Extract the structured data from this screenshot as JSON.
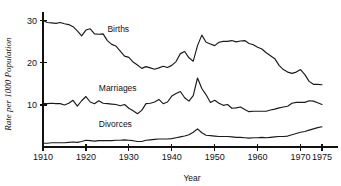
{
  "chart_data": {
    "type": "line",
    "title": "",
    "xlabel": "Year",
    "ylabel": "Rate per 1000 Population",
    "xlim": [
      1910,
      1976
    ],
    "ylim": [
      0,
      32
    ],
    "grid": false,
    "legend_position": "inline-labels",
    "xticks": [
      1910,
      1920,
      1930,
      1940,
      1950,
      1960,
      1970,
      1975
    ],
    "xtick_labels": [
      "1910",
      "1920",
      "1930",
      "1940",
      "1950",
      "1960",
      "1970",
      "1975"
    ],
    "yticks": [
      10,
      20,
      30
    ],
    "ytick_labels": [
      "10",
      "20",
      "30"
    ],
    "x": [
      1910,
      1911,
      1912,
      1913,
      1914,
      1915,
      1916,
      1917,
      1918,
      1919,
      1920,
      1921,
      1922,
      1923,
      1924,
      1925,
      1926,
      1927,
      1928,
      1929,
      1930,
      1931,
      1932,
      1933,
      1934,
      1935,
      1936,
      1937,
      1938,
      1939,
      1940,
      1941,
      1942,
      1943,
      1944,
      1945,
      1946,
      1947,
      1948,
      1949,
      1950,
      1951,
      1952,
      1953,
      1954,
      1955,
      1956,
      1957,
      1958,
      1959,
      1960,
      1961,
      1962,
      1963,
      1964,
      1965,
      1966,
      1967,
      1968,
      1969,
      1970,
      1971,
      1972,
      1973,
      1974,
      1975
    ],
    "series": [
      {
        "name": "Births",
        "label": "Births",
        "label_x": 1925,
        "label_y": 27.3,
        "values": [
          30.1,
          29.6,
          29.5,
          29.4,
          29.6,
          29.3,
          29.1,
          28.6,
          27.6,
          26.4,
          27.8,
          28.1,
          26.9,
          26.8,
          26.9,
          25.3,
          24.4,
          24.0,
          22.8,
          21.6,
          21.3,
          20.2,
          19.5,
          18.7,
          19.1,
          18.8,
          18.5,
          18.8,
          19.2,
          18.9,
          19.4,
          20.3,
          22.2,
          22.7,
          21.2,
          20.4,
          24.1,
          26.6,
          24.9,
          24.5,
          24.1,
          24.9,
          25.1,
          25.1,
          25.3,
          25.0,
          25.2,
          25.3,
          24.6,
          24.3,
          23.7,
          23.3,
          22.4,
          21.7,
          21.0,
          19.4,
          18.4,
          17.8,
          17.5,
          17.8,
          18.4,
          17.2,
          15.6,
          14.9,
          14.9,
          14.8
        ]
      },
      {
        "name": "Marriages",
        "label": "Marriages",
        "label_x": 1923,
        "label_y": 13.3,
        "values": [
          10.3,
          10.3,
          10.4,
          10.3,
          10.3,
          10.0,
          10.4,
          11.1,
          9.7,
          11.0,
          12.0,
          10.7,
          10.3,
          11.0,
          10.4,
          10.3,
          10.2,
          10.1,
          9.8,
          10.1,
          9.2,
          8.6,
          7.9,
          8.7,
          10.3,
          10.4,
          10.7,
          11.3,
          10.3,
          10.7,
          12.1,
          12.7,
          13.2,
          11.7,
          10.9,
          12.2,
          16.4,
          13.9,
          12.4,
          10.6,
          11.1,
          10.4,
          9.9,
          10.1,
          9.2,
          9.3,
          9.5,
          8.9,
          8.4,
          8.5,
          8.5,
          8.5,
          8.5,
          8.8,
          9.0,
          9.3,
          9.5,
          9.7,
          10.4,
          10.6,
          10.6,
          10.6,
          11.0,
          10.9,
          10.5,
          10.1
        ]
      },
      {
        "name": "Divorces",
        "label": "Divorces",
        "label_x": 1923,
        "label_y": 4.7,
        "values": [
          0.9,
          0.9,
          1.0,
          1.0,
          1.0,
          1.0,
          1.1,
          1.2,
          1.1,
          1.3,
          1.6,
          1.5,
          1.4,
          1.5,
          1.5,
          1.5,
          1.5,
          1.6,
          1.6,
          1.7,
          1.6,
          1.5,
          1.3,
          1.3,
          1.6,
          1.7,
          1.8,
          1.9,
          1.9,
          1.9,
          2.0,
          2.2,
          2.4,
          2.6,
          2.9,
          3.5,
          4.3,
          3.4,
          2.8,
          2.7,
          2.6,
          2.5,
          2.5,
          2.5,
          2.4,
          2.3,
          2.3,
          2.2,
          2.1,
          2.2,
          2.2,
          2.3,
          2.2,
          2.3,
          2.4,
          2.5,
          2.5,
          2.6,
          2.9,
          3.2,
          3.5,
          3.7,
          4.0,
          4.3,
          4.6,
          4.8
        ]
      }
    ]
  },
  "axis": {
    "x_title": "Year",
    "y_title": "Rate per 1000 Population"
  }
}
